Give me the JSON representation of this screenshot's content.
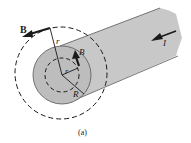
{
  "figure": {
    "caption": "(a)",
    "labels": {
      "outer_field": "B",
      "inner_field": "B",
      "outer_radius": "r",
      "inner_radius": "r",
      "wire_radius": "R",
      "current": "I"
    },
    "colors": {
      "wire": "#c8c8c8",
      "wire_end": "#b9b9b9",
      "lines": "#1a1a1a",
      "background": "#ffffff"
    }
  }
}
